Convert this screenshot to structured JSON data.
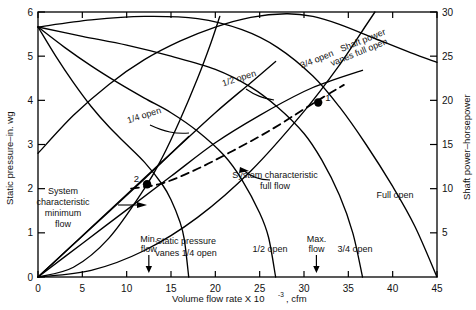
{
  "chart_data": {
    "type": "line",
    "title": "",
    "xlabel": "Volume flow rate X 10",
    "xlabel_exp": "-3",
    "xlabel_unit": ", cfm",
    "ylabel_left": "Static pressure–in. wg",
    "ylabel_right": "Shaft power–horsepower",
    "xlim": [
      0,
      45
    ],
    "ylim_left": [
      0,
      6
    ],
    "ylim_right": [
      0,
      30
    ],
    "grid": false,
    "legend": "inline-annotations",
    "xticks": [
      0,
      5,
      10,
      15,
      20,
      25,
      30,
      35,
      40,
      45
    ],
    "xticklabels": [
      "0",
      "5",
      "10",
      "15",
      "20",
      "25",
      "30",
      "35",
      "40",
      "45"
    ],
    "yticks_left": [
      0,
      1,
      2,
      3,
      4,
      5,
      6
    ],
    "yticklabels_left": [
      "0",
      "1",
      "2",
      "3",
      "4",
      "5",
      "6"
    ],
    "yticks_right": [
      5,
      10,
      15,
      20,
      25,
      30
    ],
    "yticklabels_right": [
      "5",
      "10",
      "15",
      "20",
      "25",
      "30"
    ],
    "series": [
      {
        "name": "Static pressure vanes 1/4 open",
        "axis": "left",
        "style": "solid",
        "points": [
          [
            0,
            5.66
          ],
          [
            2,
            5.0
          ],
          [
            4,
            4.4
          ],
          [
            6,
            3.86
          ],
          [
            8,
            3.4
          ],
          [
            10,
            3.0
          ],
          [
            12,
            2.6
          ],
          [
            14,
            2.1
          ],
          [
            15,
            1.75
          ],
          [
            16,
            1.25
          ],
          [
            16.5,
            0.85
          ],
          [
            17,
            0.0
          ]
        ]
      },
      {
        "name": "Static pressure vanes 1/2 open",
        "axis": "left",
        "style": "solid",
        "points": [
          [
            0,
            5.66
          ],
          [
            3,
            5.2
          ],
          [
            6,
            4.78
          ],
          [
            9,
            4.4
          ],
          [
            12,
            4.05
          ],
          [
            15,
            3.72
          ],
          [
            18,
            3.3
          ],
          [
            21,
            2.75
          ],
          [
            23,
            2.2
          ],
          [
            25,
            1.45
          ],
          [
            26,
            0.9
          ],
          [
            26.8,
            0.0
          ]
        ]
      },
      {
        "name": "Static pressure vanes 3/4 open",
        "axis": "left",
        "style": "solid",
        "points": [
          [
            0,
            5.66
          ],
          [
            5,
            5.45
          ],
          [
            10,
            5.25
          ],
          [
            15,
            5.0
          ],
          [
            20,
            4.7
          ],
          [
            24,
            4.3
          ],
          [
            27,
            3.85
          ],
          [
            30,
            3.25
          ],
          [
            32,
            2.65
          ],
          [
            34,
            1.85
          ],
          [
            35.5,
            1.0
          ],
          [
            36.6,
            0.0
          ]
        ]
      },
      {
        "name": "Static pressure vanes full open",
        "axis": "left",
        "style": "solid",
        "points": [
          [
            0,
            5.66
          ],
          [
            6,
            5.82
          ],
          [
            12,
            5.9
          ],
          [
            18,
            5.85
          ],
          [
            23,
            5.6
          ],
          [
            27,
            5.2
          ],
          [
            31,
            4.55
          ],
          [
            34,
            3.85
          ],
          [
            37,
            3.0
          ],
          [
            40,
            2.05
          ],
          [
            42.5,
            1.15
          ],
          [
            45,
            0.0
          ]
        ]
      },
      {
        "name": "Shaft power vanes 1/4 open",
        "axis": "right",
        "style": "solid",
        "points": [
          [
            0,
            0
          ],
          [
            3,
            2.8
          ],
          [
            6,
            5.6
          ],
          [
            9,
            8.4
          ],
          [
            12,
            11.2
          ],
          [
            15,
            14.0
          ],
          [
            17,
            15.9
          ]
        ]
      },
      {
        "name": "Shaft power vanes 1/2 open",
        "axis": "right",
        "style": "solid",
        "points": [
          [
            0,
            0
          ],
          [
            4,
            3.7
          ],
          [
            8,
            7.4
          ],
          [
            12,
            11.1
          ],
          [
            16,
            14.9
          ],
          [
            20,
            18.6
          ],
          [
            24,
            22.0
          ],
          [
            26.8,
            24.4
          ]
        ]
      },
      {
        "name": "Shaft power vanes 3/4 open",
        "axis": "right",
        "style": "solid",
        "points": [
          [
            0,
            0
          ],
          [
            5,
            3.8
          ],
          [
            10,
            7.6
          ],
          [
            15,
            11.4
          ],
          [
            20,
            15.2
          ],
          [
            25,
            18.3
          ],
          [
            30,
            21.0
          ],
          [
            33,
            22.2
          ],
          [
            36.6,
            23.4
          ]
        ]
      },
      {
        "name": "Shaft power vanes full open",
        "axis": "right",
        "style": "solid",
        "points": [
          [
            0,
            14.0
          ],
          [
            4,
            18.3
          ],
          [
            8,
            21.8
          ],
          [
            12,
            24.6
          ],
          [
            16,
            26.7
          ],
          [
            20,
            28.3
          ],
          [
            24,
            29.4
          ],
          [
            28,
            29.8
          ],
          [
            31,
            29.5
          ],
          [
            34,
            28.6
          ],
          [
            38,
            27.0
          ],
          [
            42,
            25.4
          ],
          [
            45,
            24.3
          ]
        ]
      },
      {
        "name": "System characteristic minimum flow",
        "axis": "left",
        "style": "solid",
        "points": [
          [
            0,
            0
          ],
          [
            4,
            0.22
          ],
          [
            8,
            0.88
          ],
          [
            12,
            2.0
          ],
          [
            14,
            2.7
          ],
          [
            16,
            3.55
          ],
          [
            18,
            4.5
          ],
          [
            19.5,
            5.3
          ],
          [
            20.5,
            5.9
          ]
        ]
      },
      {
        "name": "System characteristic full flow",
        "axis": "left",
        "style": "solid",
        "points": [
          [
            0,
            0
          ],
          [
            6,
            0.15
          ],
          [
            12,
            0.6
          ],
          [
            18,
            1.35
          ],
          [
            24,
            2.4
          ],
          [
            30,
            3.75
          ],
          [
            34,
            4.8
          ],
          [
            37,
            5.7
          ],
          [
            38,
            6.0
          ]
        ]
      },
      {
        "name": "Damper control line (points 1 to 2)",
        "axis": "left",
        "style": "dashed",
        "points": [
          [
            10.5,
            2.0
          ],
          [
            14,
            2.12
          ],
          [
            18,
            2.45
          ],
          [
            22,
            2.86
          ],
          [
            26,
            3.3
          ],
          [
            30,
            3.8
          ],
          [
            32,
            4.05
          ],
          [
            34.5,
            4.35
          ]
        ]
      }
    ],
    "operating_points": [
      {
        "label": "1",
        "x": 31.6,
        "y_left": 3.95
      },
      {
        "label": "2",
        "x": 12.3,
        "y_left": 2.1
      }
    ],
    "flow_markers": [
      {
        "label_line1": "Min.",
        "label_line2": "flow",
        "x": 12.5
      },
      {
        "label_line1": "Max.",
        "label_line2": "flow",
        "x": 31.4
      }
    ],
    "annotations": [
      {
        "id": "vanes-quarter-open-sp",
        "text": "1/4 open",
        "x": 145,
        "y": 118,
        "rotate": -18
      },
      {
        "id": "vanes-half-open-sp",
        "text": "1/2 open",
        "x": 240,
        "y": 81,
        "rotate": -18
      },
      {
        "id": "vanes-three-quarter-open-sp",
        "text": "3/4 open",
        "x": 318,
        "y": 62,
        "rotate": -22
      },
      {
        "id": "shaft-power-vanes-full-open-l1",
        "text": "Shaft power",
        "x": 364,
        "y": 43,
        "rotate": -22
      },
      {
        "id": "shaft-power-vanes-full-open-l2",
        "text": "vanes full open",
        "x": 360,
        "y": 55,
        "rotate": -22
      },
      {
        "id": "full-open-sp",
        "text": "Full open",
        "x": 395,
        "y": 198,
        "rotate": 0
      },
      {
        "id": "three-quarter-open-power",
        "text": "3/4 open",
        "x": 355,
        "y": 252,
        "rotate": 0
      },
      {
        "id": "half-open-power",
        "text": "1/2 open",
        "x": 270,
        "y": 252,
        "rotate": 0
      },
      {
        "id": "static-pressure-vanes-quarter-l1",
        "text": "Static pressure",
        "x": 186,
        "y": 244,
        "rotate": 0
      },
      {
        "id": "static-pressure-vanes-quarter-l2",
        "text": "vanes 1/4 open",
        "x": 186,
        "y": 256,
        "rotate": 0
      },
      {
        "id": "system-characteristic-minimum-flow-l1",
        "text": "System",
        "x": 63,
        "y": 194,
        "rotate": 0
      },
      {
        "id": "system-characteristic-minimum-flow-l2",
        "text": "characteristic",
        "x": 63,
        "y": 205,
        "rotate": 0
      },
      {
        "id": "system-characteristic-minimum-flow-l3",
        "text": "minimum",
        "x": 63,
        "y": 216,
        "rotate": 0
      },
      {
        "id": "system-characteristic-minimum-flow-l4",
        "text": "flow",
        "x": 63,
        "y": 227,
        "rotate": 0
      },
      {
        "id": "system-characteristic-full-flow-l1",
        "text": "System characteristic",
        "x": 275,
        "y": 178,
        "rotate": 0
      },
      {
        "id": "system-characteristic-full-flow-l2",
        "text": "full flow",
        "x": 275,
        "y": 189,
        "rotate": 0
      }
    ]
  }
}
